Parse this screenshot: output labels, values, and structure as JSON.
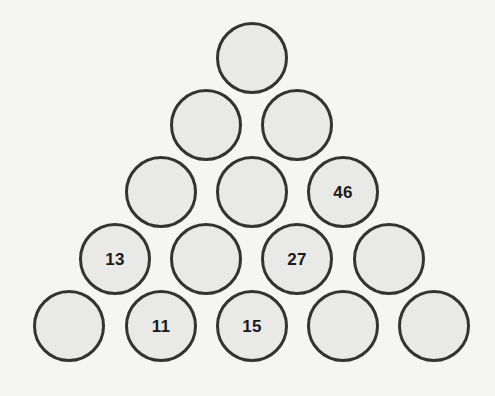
{
  "puzzle": {
    "type": "number-pyramid",
    "title": "Number Pyramid Puzzle",
    "rows_count": 5,
    "total_circles": 15,
    "colors": {
      "background": "#f5f5f3",
      "circle_fill": "#e9e9e7",
      "circle_border": "#333333",
      "text": "#1a1a1a"
    },
    "geometry": {
      "circle_radius": 36,
      "circle_diameter": 72,
      "horizontal_spacing": 91,
      "vertical_spacing": 67,
      "apex_center_x": 252,
      "apex_center_y": 58
    },
    "rows": [
      {
        "index": 1,
        "center_y": 58,
        "circles": [
          {
            "id": "r1c1",
            "value": "",
            "center_x": 252,
            "filled": false
          }
        ]
      },
      {
        "index": 2,
        "center_y": 125,
        "circles": [
          {
            "id": "r2c1",
            "value": "",
            "center_x": 206,
            "filled": false
          },
          {
            "id": "r2c2",
            "value": "",
            "center_x": 297,
            "filled": false
          }
        ]
      },
      {
        "index": 3,
        "center_y": 192,
        "circles": [
          {
            "id": "r3c1",
            "value": "",
            "center_x": 161,
            "filled": false
          },
          {
            "id": "r3c2",
            "value": "",
            "center_x": 252,
            "filled": false
          },
          {
            "id": "r3c3",
            "value": "46",
            "center_x": 343,
            "filled": true
          }
        ]
      },
      {
        "index": 4,
        "center_y": 259,
        "circles": [
          {
            "id": "r4c1",
            "value": "13",
            "center_x": 115,
            "filled": true
          },
          {
            "id": "r4c2",
            "value": "",
            "center_x": 206,
            "filled": false
          },
          {
            "id": "r4c3",
            "value": "27",
            "center_x": 297,
            "filled": true
          },
          {
            "id": "r4c4",
            "value": "",
            "center_x": 389,
            "filled": false
          }
        ]
      },
      {
        "index": 5,
        "center_y": 326,
        "circles": [
          {
            "id": "r5c1",
            "value": "",
            "center_x": 69,
            "filled": false
          },
          {
            "id": "r5c2",
            "value": "11",
            "center_x": 161,
            "filled": true
          },
          {
            "id": "r5c3",
            "value": "15",
            "center_x": 252,
            "filled": true
          },
          {
            "id": "r5c4",
            "value": "",
            "center_x": 343,
            "filled": false
          },
          {
            "id": "r5c5",
            "value": "",
            "center_x": 434,
            "filled": false
          }
        ]
      }
    ],
    "given_values": [
      "46",
      "13",
      "27",
      "11",
      "15"
    ]
  }
}
